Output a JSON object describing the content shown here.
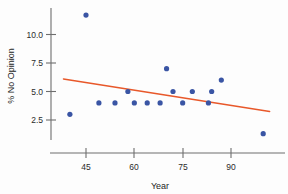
{
  "chart_data": {
    "type": "scatter",
    "title": "",
    "xlabel": "Year",
    "ylabel": "% No Opinion",
    "xlim": [
      37,
      103
    ],
    "ylim": [
      0.5,
      12.2
    ],
    "xticks": [
      45,
      60,
      75,
      90
    ],
    "xtick_labels": [
      "45",
      "60",
      "75",
      "90"
    ],
    "yticks": [
      2.5,
      5.0,
      7.5,
      10.0
    ],
    "ytick_labels": [
      "2.5",
      "5.0",
      "7.5",
      "10.0"
    ],
    "grid": false,
    "legend": "none",
    "point_color": "#3a55a4",
    "line_color": "#e8582a",
    "axis_color": "#6e6e6e",
    "points": [
      {
        "x": 40,
        "y": 3.0
      },
      {
        "x": 45,
        "y": 11.7
      },
      {
        "x": 49,
        "y": 4.0
      },
      {
        "x": 54,
        "y": 4.0
      },
      {
        "x": 58,
        "y": 5.0
      },
      {
        "x": 60,
        "y": 4.0
      },
      {
        "x": 64,
        "y": 4.0
      },
      {
        "x": 68,
        "y": 4.0
      },
      {
        "x": 70,
        "y": 7.0
      },
      {
        "x": 72,
        "y": 5.0
      },
      {
        "x": 75,
        "y": 4.0
      },
      {
        "x": 78,
        "y": 5.0
      },
      {
        "x": 83,
        "y": 4.0
      },
      {
        "x": 84,
        "y": 5.0
      },
      {
        "x": 87,
        "y": 6.0
      },
      {
        "x": 100,
        "y": 1.3
      }
    ],
    "trend_line": {
      "x_start": 38,
      "y_start": 6.1,
      "x_end": 102,
      "y_end": 3.25
    }
  }
}
